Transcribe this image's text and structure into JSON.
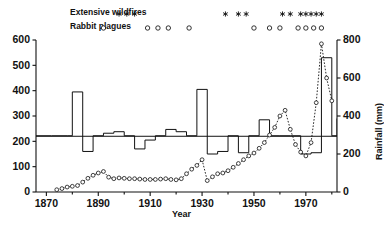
{
  "figure": {
    "xlabel": "Year",
    "ylabel_right": "Rainfall (mm)",
    "legend": {
      "wildfires_label": "Extensive wildfires",
      "rabbits_label": "Rabbit plagues",
      "wildfire_marker": "star-marker",
      "rabbit_marker": "open-circle-marker"
    }
  },
  "chart_data": {
    "type": "line",
    "title": "",
    "xlabel": "Year",
    "ylabel": "",
    "ylabel_right": "Rainfall (mm)",
    "xlim": [
      1866,
      1982
    ],
    "ylim_left": [
      0,
      600
    ],
    "ylim_right": [
      0,
      800
    ],
    "grid": false,
    "legend_position": "top",
    "x_ticks": [
      1870,
      1890,
      1910,
      1930,
      1950,
      1970
    ],
    "y_ticks_left": [
      0,
      100,
      200,
      300,
      400,
      500,
      600
    ],
    "y_ticks_right": [
      0,
      200,
      400,
      600,
      800
    ],
    "reference_line": {
      "value": 220,
      "axis": "left",
      "style": "solid"
    },
    "series": [
      {
        "name": "Step series (left axis)",
        "type": "step",
        "style": "solid",
        "axis": "left",
        "x": [
          1866,
          1872,
          1878,
          1880,
          1884,
          1888,
          1892,
          1896,
          1900,
          1904,
          1908,
          1912,
          1916,
          1920,
          1924,
          1928,
          1932,
          1936,
          1940,
          1944,
          1948,
          1952,
          1956,
          1960,
          1964,
          1968,
          1972,
          1976,
          1980,
          1982
        ],
        "values": [
          222,
          222,
          222,
          395,
          160,
          222,
          232,
          238,
          222,
          170,
          205,
          222,
          247,
          238,
          222,
          405,
          150,
          160,
          222,
          155,
          222,
          285,
          222,
          222,
          222,
          150,
          155,
          530,
          222,
          290
        ]
      },
      {
        "name": "Rainfall (right axis)",
        "type": "line",
        "style": "dotted",
        "marker": "open-circle",
        "axis": "right",
        "x": [
          1874,
          1876,
          1878,
          1880,
          1882,
          1884,
          1886,
          1888,
          1890,
          1892,
          1894,
          1896,
          1898,
          1900,
          1902,
          1904,
          1906,
          1908,
          1910,
          1912,
          1914,
          1916,
          1918,
          1920,
          1922,
          1924,
          1926,
          1928,
          1930,
          1932,
          1934,
          1936,
          1938,
          1940,
          1942,
          1944,
          1946,
          1948,
          1950,
          1952,
          1954,
          1956,
          1958,
          1960,
          1962,
          1964,
          1966,
          1968,
          1970,
          1972,
          1974,
          1976,
          1978,
          1980
        ],
        "values": [
          12,
          18,
          26,
          30,
          34,
          52,
          72,
          88,
          100,
          108,
          78,
          70,
          74,
          72,
          70,
          70,
          68,
          66,
          66,
          66,
          68,
          70,
          66,
          64,
          70,
          96,
          120,
          140,
          170,
          60,
          80,
          96,
          100,
          112,
          130,
          150,
          170,
          190,
          205,
          230,
          260,
          300,
          340,
          400,
          430,
          330,
          250,
          210,
          190,
          260,
          470,
          780,
          600,
          480
        ]
      }
    ],
    "events": {
      "wildfires": {
        "label": "Extensive wildfires",
        "marker": "star",
        "row_y_value": "top",
        "years": [
          1898,
          1901,
          1904,
          1939,
          1944,
          1947,
          1961,
          1964,
          1968,
          1970,
          1972,
          1974,
          1976
        ]
      },
      "rabbit_plagues": {
        "label": "Rabbit plagues",
        "marker": "open-circle",
        "row_y_value": "top",
        "years": [
          1892,
          1909,
          1913,
          1917,
          1925,
          1950,
          1956,
          1960,
          1967,
          1970,
          1973,
          1976
        ]
      }
    }
  },
  "axis_labels": {
    "left": [
      "600",
      "500",
      "400",
      "300",
      "200",
      "100",
      "0"
    ],
    "right": [
      "800",
      "600",
      "400",
      "200",
      "0"
    ],
    "bottom": [
      "1870",
      "1890",
      "1910",
      "1930",
      "1950",
      "1970"
    ]
  }
}
